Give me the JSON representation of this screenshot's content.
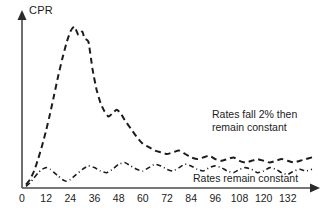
{
  "chart_data": {
    "type": "line",
    "title": "",
    "xlabel": "",
    "ylabel": "CPR",
    "xlim": [
      0,
      144
    ],
    "ylim": [
      0,
      100
    ],
    "grid": false,
    "legend": "annotations-on-plot",
    "xticks": [
      0,
      12,
      24,
      36,
      48,
      60,
      72,
      84,
      96,
      108,
      120,
      132
    ],
    "xticklabels": [
      "0",
      "12",
      "24",
      "36",
      "48",
      "60",
      "72",
      "84",
      "96",
      "108",
      "120",
      "132"
    ],
    "yticks": [],
    "yticklabels": [],
    "annotations": [
      {
        "name": "rates-fall-annotation",
        "lines": [
          "Rates fall 2% then",
          "remain constant"
        ],
        "series": "rates_fall_2pct"
      },
      {
        "name": "rates-constant-annotation",
        "lines": [
          "Rates remain constant"
        ],
        "series": "rates_remain_constant"
      }
    ],
    "series": [
      {
        "name": "rates_fall_2pct",
        "label": "Rates fall 2% then remain constant",
        "style": "dashed",
        "color": "#1c1c1c",
        "x": [
          2,
          4,
          6,
          8,
          10,
          12,
          14,
          16,
          18,
          20,
          22,
          24,
          26,
          28,
          30,
          31,
          33,
          35,
          37,
          39,
          41,
          43,
          45,
          47,
          49,
          51,
          54,
          57,
          60,
          63,
          66,
          69,
          72,
          75,
          78,
          81,
          84,
          87,
          90,
          93,
          96,
          99,
          102,
          105,
          108,
          111,
          114,
          117,
          120,
          123,
          126,
          129,
          132,
          135,
          138,
          141,
          144
        ],
        "y": [
          2,
          5,
          10,
          17,
          25,
          34,
          44,
          55,
          66,
          76,
          85,
          92,
          95,
          90,
          92,
          88,
          86,
          70,
          58,
          50,
          45,
          42,
          44,
          46,
          44,
          40,
          35,
          30,
          26,
          24,
          22,
          21,
          20,
          21,
          22,
          20,
          18,
          17,
          18,
          19,
          17,
          16,
          17,
          18,
          16,
          15,
          16,
          17,
          16,
          15,
          16,
          17,
          16,
          15,
          16,
          17,
          18
        ]
      },
      {
        "name": "rates_remain_constant",
        "label": "Rates remain constant",
        "style": "dash-dot",
        "color": "#1c1c1c",
        "x": [
          2,
          4,
          6,
          8,
          10,
          12,
          14,
          16,
          18,
          20,
          22,
          24,
          27,
          30,
          33,
          36,
          39,
          42,
          45,
          48,
          51,
          54,
          57,
          60,
          63,
          66,
          69,
          72,
          75,
          78,
          81,
          84,
          87,
          90,
          93,
          96,
          99,
          102,
          105,
          108,
          111,
          114,
          117,
          120,
          123,
          126,
          129,
          132,
          135,
          138,
          141,
          144
        ],
        "y": [
          1,
          3,
          6,
          9,
          11,
          12,
          11,
          9,
          7,
          5,
          4,
          5,
          8,
          11,
          13,
          12,
          10,
          9,
          11,
          14,
          15,
          13,
          11,
          10,
          12,
          14,
          13,
          11,
          10,
          12,
          14,
          13,
          11,
          10,
          12,
          13,
          12,
          10,
          9,
          11,
          12,
          11,
          9,
          10,
          12,
          11,
          9,
          8,
          10,
          11,
          10,
          11
        ]
      }
    ]
  },
  "axes": {
    "y_axis_label": "CPR",
    "x_axis_ticks": [
      "0",
      "12",
      "24",
      "36",
      "48",
      "60",
      "72",
      "84",
      "96",
      "108",
      "120",
      "132"
    ]
  },
  "annotations": {
    "upper_line1": "Rates fall 2% then",
    "upper_line2": "remain constant",
    "lower_line1": "Rates remain constant"
  },
  "colors": {
    "axis": "#4a4a4a",
    "curve": "#1c1c1c",
    "background": "#ffffff"
  }
}
